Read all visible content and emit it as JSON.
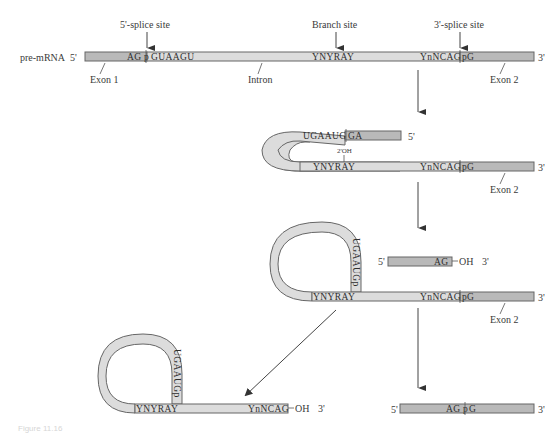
{
  "figure": {
    "caption": "Figure 11.16"
  },
  "colors": {
    "intron": "#dcdcdc",
    "exon": "#b9b9b9",
    "outline": "#666666",
    "text": "#3a3a3a"
  },
  "step1": {
    "molecule_label": "pre-mRNA",
    "five_prime": "5'",
    "three_prime": "3'",
    "five_splice_label": "5'-splice site",
    "branch_label": "Branch site",
    "three_splice_label": "3'-splice site",
    "five_seq": "AG",
    "five_seq_after": "GUAAGU",
    "branch_seq": "YNYRAY",
    "three_seq": "YnNCAG",
    "three_seq_after": "G",
    "p_mark": "p",
    "exon1_label": "Exon 1",
    "intron_label": "Intron",
    "exon2_label": "Exon 2"
  },
  "step2": {
    "loop_seq": "UGAAUG",
    "loop_after": "GA",
    "five_prime": "5'",
    "oh_label": "2'OH",
    "branch_seq": "YNYRAY",
    "three_seq": "YnNCAG",
    "three_seq_after": "G",
    "p_mark": "p",
    "three_prime": "3'",
    "exon2_label": "Exon 2"
  },
  "step3": {
    "lariat_seq": "UGAAUGp",
    "exon1_five": "5'",
    "exon1_seq": "AG",
    "exon1_oh": "OH",
    "exon1_three": "3'",
    "branch_seq": "YNYRAY",
    "three_seq": "YnNCAG",
    "three_seq_after": "G",
    "p_mark": "p",
    "three_prime": "3'",
    "exon2_label": "Exon 2"
  },
  "step4_lariat": {
    "lariat_seq": "UGAAUGp",
    "branch_seq": "YNYRAY",
    "three_seq": "YnNCAG",
    "oh": "OH",
    "three_prime": "3'"
  },
  "step4_product": {
    "five_prime": "5'",
    "seq_before": "AG",
    "p_mark": "p",
    "seq_after": "G",
    "three_prime": "3'"
  }
}
